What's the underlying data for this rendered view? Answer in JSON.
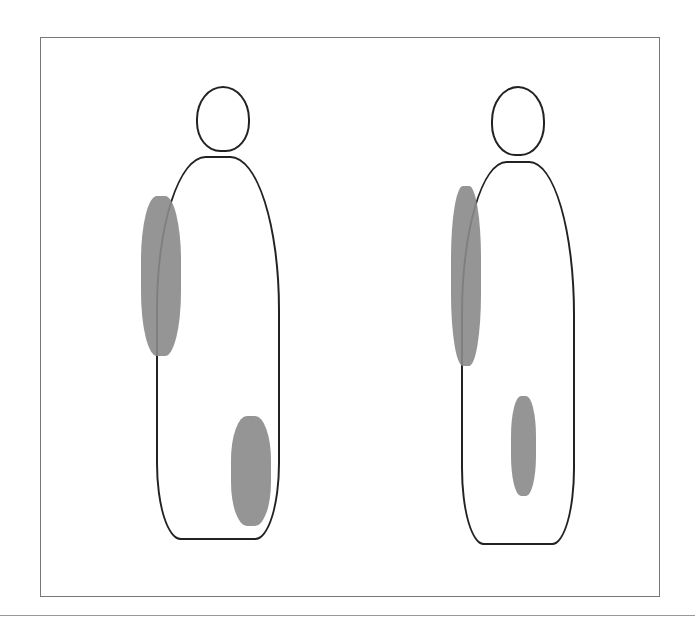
{
  "figure": {
    "figures": [
      {
        "id": "left",
        "label": "standing figure, left"
      },
      {
        "id": "right",
        "label": "standing figure, right"
      }
    ],
    "colors": {
      "line": "#222222",
      "shade": "#8a8a8a",
      "frame": "#777777",
      "background": "#ffffff"
    }
  }
}
